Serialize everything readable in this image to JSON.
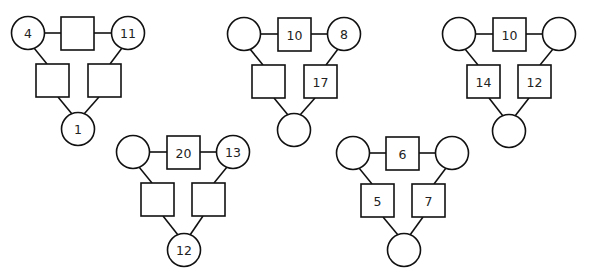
{
  "puzzles": [
    {
      "id": "puzzle-1",
      "top_left_circle": "4",
      "top_square": "",
      "top_right_circle": "11",
      "left_square": "",
      "right_square": "",
      "bottom_circle": "1"
    },
    {
      "id": "puzzle-2",
      "top_left_circle": "",
      "top_square": "10",
      "top_right_circle": "8",
      "left_square": "",
      "right_square": "17",
      "bottom_circle": ""
    },
    {
      "id": "puzzle-3",
      "top_left_circle": "",
      "top_square": "10",
      "top_right_circle": "",
      "left_square": "14",
      "right_square": "12",
      "bottom_circle": ""
    },
    {
      "id": "puzzle-4",
      "top_left_circle": "",
      "top_square": "20",
      "top_right_circle": "13",
      "left_square": "",
      "right_square": "",
      "bottom_circle": "12"
    },
    {
      "id": "puzzle-5",
      "top_left_circle": "",
      "top_square": "6",
      "top_right_circle": "",
      "left_square": "5",
      "right_square": "7",
      "bottom_circle": ""
    }
  ]
}
